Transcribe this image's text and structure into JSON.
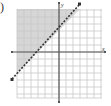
{
  "problem": {
    "label_fragment": ")"
  },
  "chart_data": {
    "type": "line",
    "title": "",
    "xlabel": "x",
    "ylabel": "y",
    "xlim": [
      -6,
      6
    ],
    "ylim": [
      -6,
      6
    ],
    "grid": true,
    "boundary_line": {
      "equation": "y = x + 3",
      "slope": 1,
      "y_intercept": 3,
      "style": "dashed",
      "arrows": "both",
      "points": [
        {
          "x": -7,
          "y": -4
        },
        {
          "x": 3,
          "y": 7
        }
      ]
    },
    "shaded_region": "above line (y > x + 3)",
    "inequality": "y > x + 3"
  },
  "colors": {
    "grid": "#c8c8c8",
    "axis": "#555555",
    "line": "#333333",
    "shade": "#d6d6d6"
  },
  "axes": {
    "x_label": "x",
    "y_label": "y"
  }
}
